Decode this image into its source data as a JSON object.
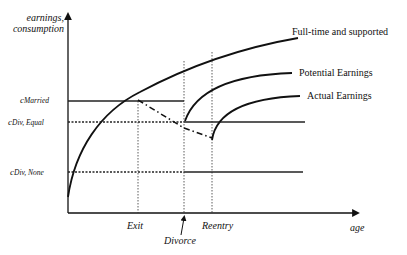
{
  "diagram": {
    "y_axis_label_line1": "earnings,",
    "y_axis_label_line2": "consumption",
    "x_axis_label": "age",
    "levels": [
      {
        "symbol": "c",
        "subscript": "Married",
        "style": "solid"
      },
      {
        "symbol": "c",
        "subscript": "Div, Equal",
        "style": "dotted-then-solid"
      },
      {
        "symbol": "c",
        "subscript": "Div, None",
        "style": "dotted-then-solid"
      }
    ],
    "x_markers": [
      {
        "label": "Exit"
      },
      {
        "label": "Divorce",
        "has_arrow": true
      },
      {
        "label": "Reentry"
      }
    ],
    "curves": [
      {
        "label": "Full-time and supported"
      },
      {
        "label": "Potential Earnings"
      },
      {
        "label": "Actual Earnings"
      }
    ],
    "colors": {
      "line": "#111111",
      "background": "#ffffff"
    }
  }
}
